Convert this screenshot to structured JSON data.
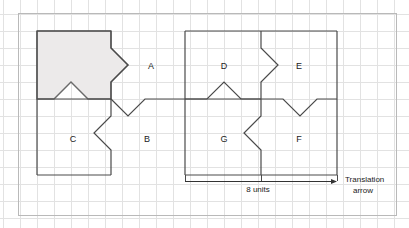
{
  "figure": {
    "title_text": "",
    "outer_frame": {
      "x": 18,
      "y": 13,
      "width": 378,
      "height": 202,
      "stroke": "#b9b9b9"
    },
    "grid": {
      "cell_size": 17,
      "origin_x": 3,
      "origin_y": 14,
      "line_color": "#e2e2e2",
      "visible": true
    },
    "colors": {
      "shape_stroke": "#4a4a4a",
      "shaded_fill": "#eceaea",
      "shaded_stroke": "#6a6a6a",
      "grid_line": "#e2e2e2",
      "frame": "#b9b9b9",
      "text": "#222222",
      "arrow": "#333333"
    },
    "shape_labels": [
      {
        "id": "A",
        "text": "A",
        "x": 151,
        "y": 67
      },
      {
        "id": "B",
        "text": "B",
        "x": 147,
        "y": 140
      },
      {
        "id": "C",
        "text": "C",
        "x": 73,
        "y": 140
      },
      {
        "id": "D",
        "text": "D",
        "x": 224,
        "y": 67
      },
      {
        "id": "E",
        "text": "E",
        "x": 299,
        "y": 67
      },
      {
        "id": "F",
        "text": "F",
        "x": 299,
        "y": 140
      },
      {
        "id": "G",
        "text": "G",
        "x": 224,
        "y": 140
      }
    ],
    "annotations": {
      "measure_label": "8 units",
      "measure_label_x": 258,
      "measure_label_y": 192,
      "arrow_label_line1": "Translation",
      "arrow_label_line2": "arrow",
      "arrow_label_x": 345,
      "arrow_label_y": 182,
      "arrow_start_x": 185,
      "arrow_end_x": 337,
      "arrow_y": 181
    },
    "tick_marks": [
      {
        "x": 185,
        "y_top": 175,
        "y_bottom": 181
      },
      {
        "x": 261,
        "y_top": 175,
        "y_bottom": 181
      },
      {
        "x": 337,
        "y_top": 175,
        "y_bottom": 181
      }
    ],
    "shaded_piece": {
      "name": "shaded-source-tile",
      "path": "M 37 31 L 111 31 L 111 48 L 128 65 L 111 82 L 111 99 L 88 99 L 71 82 L 54 99 L 37 99 Z"
    },
    "outline_paths": [
      {
        "name": "group-left-outer-top",
        "d": "M 37 31 L 111 31"
      },
      {
        "name": "group-left-outer-left",
        "d": "M 37 31 L 37 175"
      },
      {
        "name": "group-left-outer-bottom",
        "d": "M 37 175 L 111 175"
      },
      {
        "name": "divider-left-mid",
        "d": "M 37 99 L 111 99"
      },
      {
        "name": "tile-a-right-edge",
        "d": "M 111 31 L 111 48 L 128 65 L 111 82 L 111 99"
      },
      {
        "name": "tile-b-top-edge",
        "d": "M 111 99 L 128 116 L 145 99 L 185 99"
      },
      {
        "name": "tile-c-right-edge",
        "d": "M 111 99 L 111 116 L 94 133 L 111 150 L 111 175"
      },
      {
        "name": "group-right-outer-top",
        "d": "M 185 31 L 261 31"
      },
      {
        "name": "group-right-outer-left",
        "d": "M 185 31 L 185 175"
      },
      {
        "name": "group-right-outer-bottom",
        "d": "M 185 175 L 261 175"
      },
      {
        "name": "divider-right-mid",
        "d": "M 185 99 L 261 99"
      },
      {
        "name": "tile-d-right-edge",
        "d": "M 261 31 L 261 48 L 278 65 L 261 82 L 261 99"
      },
      {
        "name": "tile-d-bottom-zig",
        "d": "M 185 99 L 207 99 L 224 82 L 241 99 L 261 99"
      },
      {
        "name": "tile-e-top",
        "d": "M 261 31 L 337 31"
      },
      {
        "name": "tile-e-right",
        "d": "M 337 31 L 337 175"
      },
      {
        "name": "tile-e-bottom",
        "d": "M 261 99 L 283 99 L 300 116 L 317 99 L 337 99"
      },
      {
        "name": "tile-g-right-edge",
        "d": "M 261 99 L 261 116 L 244 133 L 261 150 L 261 175"
      },
      {
        "name": "tile-f-bottom",
        "d": "M 261 175 L 337 175"
      }
    ]
  }
}
